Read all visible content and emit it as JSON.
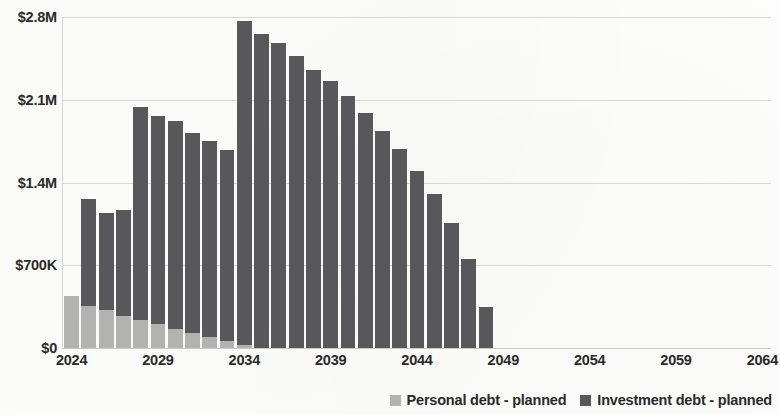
{
  "chart_data": {
    "type": "bar",
    "stacked": true,
    "title": "",
    "subtitle": "",
    "xlabel": "",
    "ylabel": "",
    "grid": true,
    "legend_position": "bottom-right",
    "xlim": [
      2024,
      2064
    ],
    "ylim": [
      0,
      2800000
    ],
    "y_ticks": [
      0,
      700000,
      1400000,
      2100000,
      2800000
    ],
    "y_tick_labels": [
      "$0",
      "$700K",
      "$1.4M",
      "$2.1M",
      "$2.8M"
    ],
    "x_ticks": [
      2024,
      2029,
      2034,
      2039,
      2044,
      2049,
      2054,
      2059,
      2064
    ],
    "x_tick_labels": [
      "2024",
      "2029",
      "2034",
      "2039",
      "2044",
      "2049",
      "2054",
      "2059",
      "2064"
    ],
    "categories": [
      2024,
      2025,
      2026,
      2027,
      2028,
      2029,
      2030,
      2031,
      2032,
      2033,
      2034,
      2035,
      2036,
      2037,
      2038,
      2039,
      2040,
      2041,
      2042,
      2043,
      2044,
      2045,
      2046,
      2047,
      2048
    ],
    "series": [
      {
        "name": "Personal debt - planned",
        "color": "#b2b2b0",
        "values": [
          440000,
          355000,
          320000,
          270000,
          235000,
          200000,
          165000,
          130000,
          95000,
          60000,
          25000,
          0,
          0,
          0,
          0,
          0,
          0,
          0,
          0,
          0,
          0,
          0,
          0,
          0,
          0
        ]
      },
      {
        "name": "Investment debt - planned",
        "color": "#58585a",
        "values": [
          0,
          905000,
          820000,
          900000,
          1805000,
          1760000,
          1755000,
          1685000,
          1655000,
          1615000,
          2740000,
          2660000,
          2580000,
          2470000,
          2350000,
          2255000,
          2130000,
          1990000,
          1840000,
          1680000,
          1500000,
          1300000,
          1060000,
          750000,
          345000
        ]
      }
    ],
    "totals": [
      440000,
      1260000,
      1140000,
      1170000,
      2040000,
      1960000,
      1920000,
      1815000,
      1750000,
      1675000,
      2765000,
      2660000,
      2580000,
      2470000,
      2350000,
      2255000,
      2130000,
      1990000,
      1840000,
      1680000,
      1500000,
      1300000,
      1060000,
      750000,
      345000
    ]
  },
  "legend": {
    "items": [
      {
        "label": "Personal debt - planned",
        "color": "#b2b2b0",
        "swatch_name": "legend-swatch-personal-debt"
      },
      {
        "label": "Investment debt - planned",
        "color": "#58585a",
        "swatch_name": "legend-swatch-investment-debt"
      }
    ]
  }
}
